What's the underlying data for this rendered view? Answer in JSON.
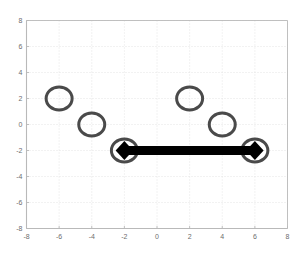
{
  "chart_data": {
    "type": "scatter",
    "title": "",
    "xlabel": "",
    "ylabel": "",
    "xlim": [
      -8,
      8
    ],
    "ylim": [
      -8,
      8
    ],
    "grid": true,
    "grid_style": "dotted",
    "legend": "none",
    "xticks": [
      -8,
      -6,
      -4,
      -2,
      0,
      2,
      4,
      6,
      8
    ],
    "yticks": [
      -8,
      -6,
      -4,
      -2,
      0,
      2,
      4,
      6,
      8
    ],
    "xtick_labels": [
      "-8",
      "-6",
      "-4",
      "-2",
      "0",
      "2",
      "4",
      "6",
      "8"
    ],
    "ytick_labels": [
      "-8",
      "-6",
      "-4",
      "-2",
      "0",
      "2",
      "4",
      "6",
      "8"
    ],
    "series": [
      {
        "name": "nodes",
        "type": "scatter",
        "marker": "circle-open",
        "marker_color": "#4a4a4a",
        "marker_size": 26,
        "marker_linewidth": 3,
        "points": [
          {
            "x": -6,
            "y": 2
          },
          {
            "x": -4,
            "y": 0
          },
          {
            "x": -2,
            "y": -2
          },
          {
            "x": 2,
            "y": 2
          },
          {
            "x": 4,
            "y": 0
          },
          {
            "x": 6,
            "y": -2
          }
        ]
      },
      {
        "name": "link",
        "type": "line",
        "line_color": "#000000",
        "line_width": 9,
        "marker": "diamond-filled",
        "marker_color": "#000000",
        "marker_size": 19,
        "points": [
          {
            "x": -2,
            "y": -2
          },
          {
            "x": 6,
            "y": -2
          }
        ]
      }
    ]
  },
  "colors": {
    "background": "#ffffff",
    "axis": "#b9b9b9",
    "grid": "#dedede",
    "tick_label": "#6e6e6e",
    "circle_stroke": "#4a4a4a",
    "link": "#000000"
  }
}
